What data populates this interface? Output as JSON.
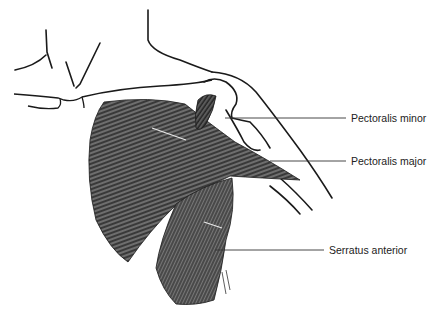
{
  "figure": {
    "colors": {
      "background": "#ffffff",
      "outline": "#1a1a1a",
      "muscle_dark": "#3a3a3a",
      "muscle_mid": "#6e6e6e",
      "leader_line": "#333333",
      "label_text": "#222222"
    }
  },
  "labels": [
    {
      "id": "pectoralis-minor",
      "text": "Pectoralis minor",
      "x": 351,
      "y": 112,
      "line_from": [
        225,
        118
      ],
      "line_to": [
        346,
        118
      ]
    },
    {
      "id": "pectoralis-major",
      "text": "Pectoralis major",
      "x": 351,
      "y": 155,
      "line_from": [
        270,
        161
      ],
      "line_to": [
        346,
        161
      ]
    },
    {
      "id": "serratus-anterior",
      "text": "Serratus anterior",
      "x": 329,
      "y": 244,
      "line_from": [
        215,
        250
      ],
      "line_to": [
        324,
        250
      ]
    }
  ],
  "signature": "artist signature (illegible)"
}
